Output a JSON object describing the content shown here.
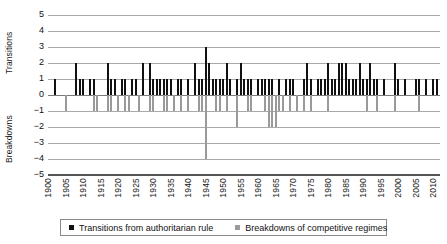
{
  "chart_data": {
    "type": "bar",
    "title": "",
    "xlabel": "",
    "ylabel_top": "Transitions",
    "ylabel_bottom": "Breakdowns",
    "ylim": [
      -5,
      5
    ],
    "yticks": [
      5,
      4,
      3,
      2,
      1,
      0,
      -1,
      -2,
      -3,
      -4,
      -5
    ],
    "ytick_labels": [
      "5",
      "4",
      "3",
      "2",
      "1",
      "0",
      "−1",
      "−2",
      "−3",
      "−4",
      "−5"
    ],
    "xlim": [
      1900,
      2012
    ],
    "xticks": [
      1900,
      1905,
      1910,
      1915,
      1920,
      1925,
      1930,
      1935,
      1940,
      1945,
      1950,
      1955,
      1960,
      1965,
      1970,
      1975,
      1980,
      1985,
      1990,
      1995,
      2000,
      2005,
      2010
    ],
    "xtick_labels": [
      "1900",
      "1905",
      "1910",
      "1915",
      "1920",
      "1925",
      "1930",
      "1935",
      "1940",
      "1945",
      "1950",
      "1955",
      "1960",
      "1965",
      "1970",
      "1975",
      "1980",
      "1985",
      "1990",
      "1995",
      "2000",
      "2005",
      "2010"
    ],
    "grid": true,
    "legend_position": "bottom",
    "colors": {
      "transitions": "#111111",
      "breakdowns": "#9a9a9a",
      "gridline": "#a9a9a9",
      "axis": "#555555",
      "background": "#ffffff"
    },
    "series": [
      {
        "name": "Transitions from authoritarian rule",
        "color": "#111111",
        "x": [
          1902,
          1908,
          1909,
          1910,
          1912,
          1913,
          1917,
          1918,
          1919,
          1921,
          1922,
          1924,
          1925,
          1927,
          1929,
          1930,
          1931,
          1932,
          1933,
          1934,
          1935,
          1937,
          1938,
          1940,
          1942,
          1943,
          1944,
          1945,
          1946,
          1947,
          1948,
          1949,
          1950,
          1951,
          1952,
          1954,
          1955,
          1956,
          1957,
          1958,
          1960,
          1961,
          1962,
          1963,
          1964,
          1966,
          1968,
          1969,
          1970,
          1973,
          1974,
          1975,
          1977,
          1978,
          1979,
          1980,
          1981,
          1982,
          1983,
          1984,
          1985,
          1986,
          1987,
          1988,
          1989,
          1990,
          1991,
          1992,
          1993,
          1994,
          1996,
          1999,
          2000,
          2002,
          2005,
          2006,
          2008,
          2010,
          2011
        ],
        "values": [
          1,
          2,
          1,
          1,
          1,
          1,
          2,
          1,
          1,
          1,
          1,
          1,
          1,
          2,
          2,
          1,
          1,
          1,
          1,
          1,
          1,
          1,
          1,
          1,
          2,
          1,
          1,
          3,
          2,
          1,
          1,
          1,
          1,
          2,
          1,
          1,
          2,
          1,
          1,
          1,
          1,
          1,
          1,
          1,
          1,
          1,
          1,
          1,
          1,
          1,
          2,
          1,
          1,
          1,
          1,
          2,
          1,
          1,
          2,
          2,
          2,
          1,
          1,
          1,
          2,
          1,
          1,
          2,
          1,
          1,
          1,
          2,
          1,
          1,
          1,
          1,
          1,
          1,
          1
        ]
      },
      {
        "name": "Breakdowns of competitive regimes",
        "color": "#9a9a9a",
        "x": [
          1905,
          1913,
          1914,
          1917,
          1918,
          1920,
          1922,
          1923,
          1926,
          1929,
          1930,
          1933,
          1934,
          1936,
          1938,
          1940,
          1943,
          1944,
          1945,
          1948,
          1949,
          1951,
          1954,
          1957,
          1958,
          1962,
          1963,
          1964,
          1965,
          1966,
          1967,
          1969,
          1971,
          1973,
          1975,
          1980,
          1991,
          1994,
          1999,
          2006
        ],
        "values": [
          -1,
          -1,
          -1,
          -1,
          -1,
          -1,
          -1,
          -1,
          -1,
          -1,
          -1,
          -1,
          -1,
          -1,
          -1,
          -1,
          -1,
          -1,
          -4,
          -1,
          -1,
          -1,
          -2,
          -1,
          -1,
          -1,
          -2,
          -2,
          -2,
          -1,
          -1,
          -1,
          -1,
          -1,
          -1,
          -1,
          -1,
          -1,
          -1,
          -1
        ]
      }
    ]
  },
  "legend": {
    "items": [
      {
        "label": "Transitions from authoritarian rule",
        "marker": "black-square-marker"
      },
      {
        "label": "Breakdowns of competitive regimes",
        "marker": "gray-square-marker"
      }
    ]
  }
}
